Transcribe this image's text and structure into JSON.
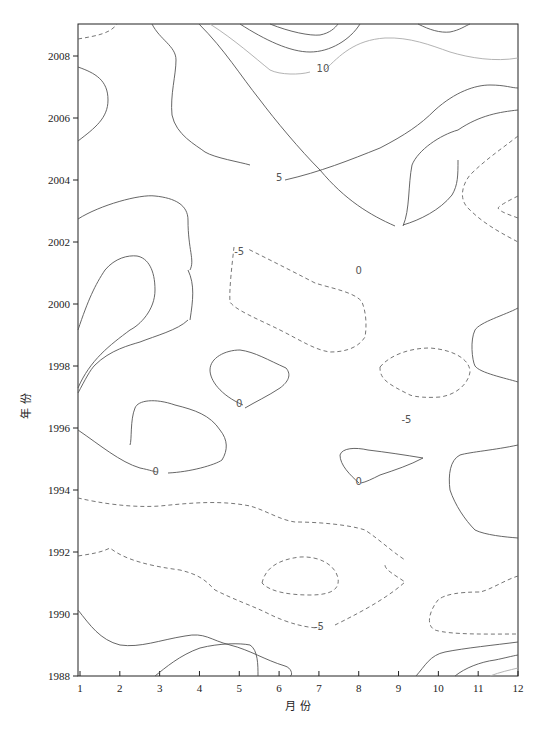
{
  "chart_data": {
    "type": "contour",
    "title": "",
    "xlabel": "月 份",
    "ylabel": "年 份",
    "x_ticks": [
      "1",
      "2",
      "3",
      "4",
      "5",
      "6",
      "7",
      "8",
      "9",
      "10",
      "11",
      "12"
    ],
    "y_ticks": [
      "1988",
      "1990",
      "1992",
      "1994",
      "1996",
      "1998",
      "2000",
      "2002",
      "2004",
      "2006",
      "2008"
    ],
    "xlim": [
      1,
      12
    ],
    "ylim": [
      1988,
      2009
    ],
    "contour_levels": [
      -5,
      0,
      5,
      10
    ],
    "contour_labels": [
      {
        "text": "10",
        "x": 7.1,
        "y": 2007.6
      },
      {
        "text": "5",
        "x": 6.0,
        "y": 2004.1
      },
      {
        "text": "0",
        "x": 8.0,
        "y": 2001.1
      },
      {
        "text": "-5",
        "x": 5.0,
        "y": 2001.7
      },
      {
        "text": "0",
        "x": 5.0,
        "y": 1996.8
      },
      {
        "text": "-5",
        "x": 9.2,
        "y": 1996.3
      },
      {
        "text": "0",
        "x": 2.9,
        "y": 1994.6
      },
      {
        "text": "0",
        "x": 8.0,
        "y": 1994.3
      },
      {
        "text": "-5",
        "x": 7.0,
        "y": 1989.6
      }
    ],
    "line_styles": {
      "positive": "solid",
      "zero": "solid",
      "negative": "dashed"
    },
    "grid": false,
    "legend": "none"
  },
  "axes": {
    "xlabel": "月 份",
    "ylabel": "年 份"
  }
}
